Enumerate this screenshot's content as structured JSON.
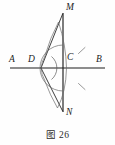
{
  "figure": {
    "caption_prefix": "图",
    "caption_number": "26",
    "caption_full": "图 26",
    "type": "geometric-construction-diagram",
    "stroke_color": "#1c1c1c",
    "background_color": "#fefefe"
  },
  "labels": {
    "A": "A",
    "B": "B",
    "C": "C",
    "D": "D",
    "M": "M",
    "N": "N"
  },
  "points": {
    "A": {
      "label": "A",
      "x": 12,
      "y": 68
    },
    "B": {
      "label": "B",
      "x": 104,
      "y": 68
    },
    "C": {
      "label": "C",
      "x": 63,
      "y": 68
    },
    "D": {
      "label": "D",
      "x": 41,
      "y": 68
    },
    "M": {
      "label": "M",
      "x": 63,
      "y": 13
    },
    "N": {
      "label": "N",
      "x": 63,
      "y": 112
    }
  },
  "segments": [
    {
      "name": "line-AB",
      "from": "A",
      "to": "B"
    },
    {
      "name": "line-MN",
      "from": "M",
      "to": "N"
    },
    {
      "name": "line-DM",
      "from": "D",
      "to": "M"
    },
    {
      "name": "line-DN",
      "from": "D",
      "to": "N"
    }
  ],
  "arcs": [
    {
      "name": "angle-arc-at-D",
      "center": "D",
      "radius": 14,
      "marks": 0
    },
    {
      "name": "construction-arc-left",
      "center": "M-N-lens-left",
      "marks": 0
    },
    {
      "name": "construction-arc-right",
      "center": "M-N-lens-right",
      "marks": 0
    },
    {
      "name": "compass-arc-at-C",
      "center": "C",
      "radius": 23,
      "marks": 2
    }
  ],
  "tick_marks": [
    {
      "name": "tick-upper-right",
      "x": 82,
      "y": 50
    },
    {
      "name": "tick-lower-right",
      "x": 82,
      "y": 87
    }
  ]
}
